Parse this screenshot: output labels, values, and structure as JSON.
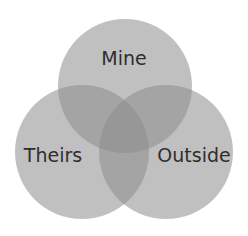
{
  "diagram": {
    "type": "venn",
    "sets": [
      {
        "id": "mine",
        "label": "Mine",
        "cx": 125,
        "cy": 86,
        "r": 67
      },
      {
        "id": "theirs",
        "label": "Theirs",
        "cx": 82,
        "cy": 152,
        "r": 67
      },
      {
        "id": "outside",
        "label": "Outside",
        "cx": 166,
        "cy": 152,
        "r": 67
      }
    ],
    "colors": {
      "circle_fill": "#8c8c8c",
      "circle_opacity": "0.55",
      "background": "#ffffff",
      "text": "#2e2e2e"
    }
  }
}
